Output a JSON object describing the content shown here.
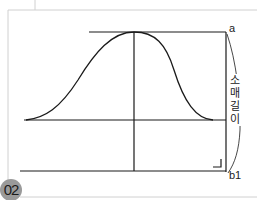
{
  "diagram": {
    "figure_number": "02",
    "point_labels": {
      "top": "a",
      "bottom": "b1"
    },
    "dimension_label": [
      "소",
      "매",
      "길",
      "이"
    ],
    "dimension_label_full": "소매길이",
    "colors": {
      "line": "#1a1a1a",
      "frame": "#cfcfcf",
      "badge": "#9a9a9a"
    }
  }
}
